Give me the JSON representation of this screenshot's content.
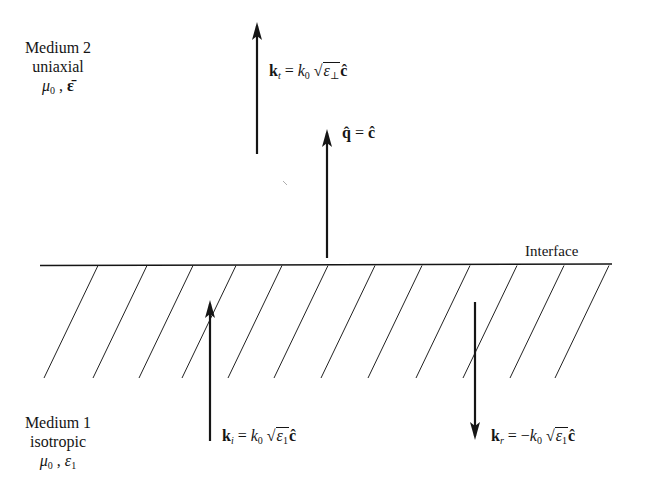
{
  "diagram": {
    "interface_label": "Interface",
    "medium2": {
      "name": "Medium 2",
      "type": "uniaxial",
      "params": "μ₀ , ε̄",
      "mu": "μ",
      "mu_sub": "0",
      "eps": "ε̄"
    },
    "medium1": {
      "name": "Medium 1",
      "type": "isotropic",
      "params": "μ₀ , ε₁",
      "mu": "μ",
      "mu_sub": "0",
      "eps": "ε",
      "eps_sub": "1"
    },
    "vectors": {
      "transmitted": {
        "label": "k_t = k_0 √(ε_⊥) ĉ",
        "k": "k",
        "k_sub": "t",
        "eq": " = ",
        "k0": "k",
        "k0_sub": "0",
        "eps": "ε",
        "eps_sub": "⊥",
        "c": "ĉ",
        "direction": "up"
      },
      "optic_axis": {
        "label": "q̂ = ĉ",
        "q": "q̂",
        "eq": " = ",
        "c": "ĉ",
        "direction": "up"
      },
      "incident": {
        "label": "k_i = k_0 √(ε_1) ĉ",
        "k": "k",
        "k_sub": "i",
        "eq": " = ",
        "k0": "k",
        "k0_sub": "0",
        "eps": "ε",
        "eps_sub": "1",
        "c": "ĉ",
        "direction": "up"
      },
      "reflected": {
        "label": "k_r = −k_0 √(ε_1) ĉ",
        "k": "k",
        "k_sub": "r",
        "eq": " = −",
        "k0": "k",
        "k0_sub": "0",
        "eps": "ε",
        "eps_sub": "1",
        "c": "ĉ",
        "direction": "down"
      }
    },
    "geometry": {
      "interface": {
        "x1": 40,
        "x2": 612,
        "y": 265
      },
      "hatch_tops_x": [
        98,
        147,
        193,
        236,
        282,
        328,
        375,
        422,
        470,
        517,
        564,
        609
      ],
      "hatch_dx": -54,
      "hatch_bottom_y": 378,
      "arrows": {
        "transmitted": {
          "x": 257,
          "y_tail": 154,
          "y_head": 24
        },
        "optic_axis": {
          "x": 327,
          "y_tail": 258,
          "y_head": 131
        },
        "incident": {
          "x": 210,
          "y_tail": 441,
          "y_head": 302
        },
        "reflected": {
          "x": 475,
          "y_tail": 302,
          "y_head": 439
        }
      }
    },
    "colors": {
      "ink": "#151515",
      "background": "#ffffff"
    }
  }
}
